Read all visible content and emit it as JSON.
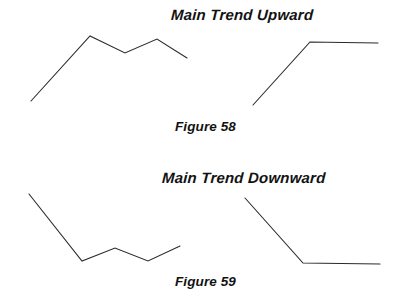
{
  "figure": {
    "background_color": "#ffffff",
    "stroke_color": "#2b2b2b",
    "width": 395,
    "height": 303
  },
  "panels": [
    {
      "id": "panel-top-left",
      "caption_group": "Figure 58",
      "description": "Main Trend Upward - rising zigzag"
    },
    {
      "id": "panel-top-right",
      "caption_group": "Figure 58",
      "description": "Main Trend Upward - steep rise then flat"
    },
    {
      "id": "panel-bottom-left",
      "caption_group": "Figure 59",
      "description": "Main Trend Downward - falling then sideways zigzag"
    },
    {
      "id": "panel-bottom-right",
      "caption_group": "Figure 59",
      "description": "Main Trend Downward - steep fall then flat"
    }
  ],
  "titles": {
    "upward": "Main Trend Upward",
    "downward": "Main Trend Downward"
  },
  "captions": {
    "figure_58": "Figure 58",
    "figure_59": "Figure 59"
  },
  "chart_data": {
    "type": "line",
    "subtitle": "",
    "xlabel": "",
    "ylabel": "",
    "grid": false,
    "legend": "none",
    "axis_visible": false,
    "xlim": [
      0,
      395
    ],
    "ylim": [
      303,
      0
    ],
    "note": "Coordinates are in image pixel space; y increases downward.",
    "series": [
      {
        "name": "Main Trend Upward - zigzag advance",
        "panel": "panel-top-left",
        "stroke": "#2b2b2b",
        "points": [
          [
            31,
            101
          ],
          [
            90,
            36
          ],
          [
            125,
            53
          ],
          [
            157,
            39
          ],
          [
            187,
            58
          ]
        ]
      },
      {
        "name": "Main Trend Upward - thrust then consolidation",
        "panel": "panel-top-right",
        "stroke": "#2b2b2b",
        "points": [
          [
            253,
            105
          ],
          [
            310,
            42
          ],
          [
            378,
            43
          ]
        ]
      },
      {
        "name": "Main Trend Downward - zigzag decline",
        "panel": "panel-bottom-left",
        "stroke": "#2b2b2b",
        "points": [
          [
            29,
            194
          ],
          [
            82,
            261
          ],
          [
            115,
            248
          ],
          [
            148,
            261
          ],
          [
            180,
            246
          ]
        ]
      },
      {
        "name": "Main Trend Downward - drop then flat base",
        "panel": "panel-bottom-right",
        "stroke": "#2b2b2b",
        "points": [
          [
            245,
            198
          ],
          [
            303,
            263
          ],
          [
            380,
            264
          ]
        ]
      }
    ]
  }
}
